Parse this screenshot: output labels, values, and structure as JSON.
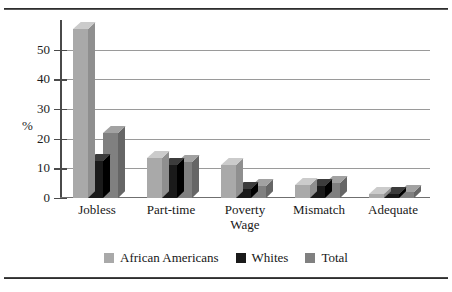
{
  "figure": {
    "ylabel": "%",
    "legend_position": "bottom-center"
  },
  "chart_data": {
    "type": "bar",
    "title": "",
    "subtitle": "",
    "xlabel": "",
    "ylabel": "%",
    "ylim": [
      0,
      60
    ],
    "yticks": [
      0,
      10,
      20,
      30,
      40,
      50
    ],
    "ytick_labels": [
      "0",
      "10",
      "20",
      "30",
      "40",
      "50"
    ],
    "grid": true,
    "grid_axis": "y",
    "legend": [
      "African Americans",
      "Whites",
      "Total"
    ],
    "legend_position": "bottom-center",
    "categories": [
      "Jobless",
      "Part-time",
      "Poverty Wage",
      "Mismatch",
      "Adequate"
    ],
    "category_labels": [
      [
        "Jobless"
      ],
      [
        "Part-time"
      ],
      [
        "Poverty",
        "Wage"
      ],
      [
        "Mismatch"
      ],
      [
        "Adequate"
      ]
    ],
    "series": [
      {
        "name": "African Americans",
        "color": "#a9a9a9",
        "values": [
          57,
          13.5,
          11,
          4.5,
          1.5
        ]
      },
      {
        "name": "Whites",
        "color": "#1a1a1a",
        "values": [
          12.5,
          11,
          3,
          4,
          1.5
        ]
      },
      {
        "name": "Total",
        "color": "#808080",
        "values": [
          22,
          12,
          4,
          5,
          2
        ]
      }
    ],
    "style": "3d-bars",
    "annotations": []
  }
}
